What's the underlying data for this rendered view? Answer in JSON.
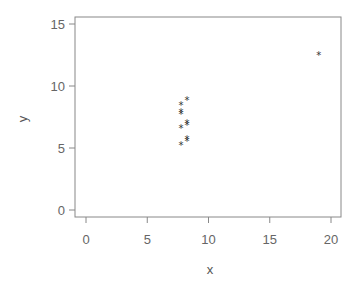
{
  "chart_data": {
    "type": "scatter",
    "title": "",
    "xlabel": "x",
    "ylabel": "y",
    "xlim": [
      -1,
      21
    ],
    "ylim": [
      -0.5,
      15.5
    ],
    "xticks": [
      0,
      5,
      10,
      15,
      20
    ],
    "yticks": [
      0,
      5,
      10,
      15
    ],
    "grid": false,
    "legend": null,
    "marker": "*",
    "series": [
      {
        "name": "points",
        "x": [
          8,
          8,
          8,
          8,
          8,
          8,
          8,
          19,
          8,
          8,
          8
        ],
        "y": [
          6.58,
          5.76,
          7.71,
          8.84,
          8.47,
          7.04,
          5.25,
          12.5,
          5.56,
          7.91,
          6.89
        ]
      }
    ]
  },
  "colors": {
    "axis": "#888888",
    "marker": "#333333",
    "text": "#666666"
  }
}
